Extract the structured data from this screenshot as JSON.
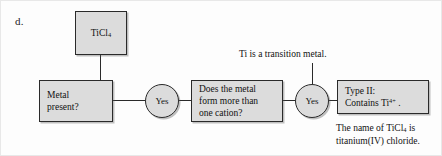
{
  "figure": {
    "item_letter": "d.",
    "type": "flowchart"
  },
  "nodes": {
    "compound": {
      "label": "TiCl4",
      "label_html": "TiCl<sub>4</sub>",
      "shape": "rectangle"
    },
    "metal_present": {
      "label": "Metal\npresent?",
      "shape": "rectangle"
    },
    "more_cation": {
      "label": "Does the metal\nform more than\none cation?",
      "shape": "rectangle"
    },
    "type_two": {
      "label": "Type II:\nContains Ti4+ .",
      "line1": "Type II:",
      "line2_html": "Contains Ti<sup>4+</sup> .",
      "shape": "rectangle"
    },
    "yes_1": {
      "label": "Yes",
      "shape": "circle"
    },
    "yes_2": {
      "label": "Yes",
      "shape": "circle"
    }
  },
  "annotations": {
    "transition_metal": "Ti is a transition metal.",
    "compound_name": "The name of TiCl4 is\ntitanium(IV) chloride.",
    "compound_name_html": "The name of TiCl<sub>4</sub> is<br>titanium(IV) chloride."
  },
  "colors": {
    "node_fill": "#dcdcdc",
    "node_stroke": "#2a2a2a",
    "text": "#111111",
    "page_background": "#fdfdfd"
  }
}
